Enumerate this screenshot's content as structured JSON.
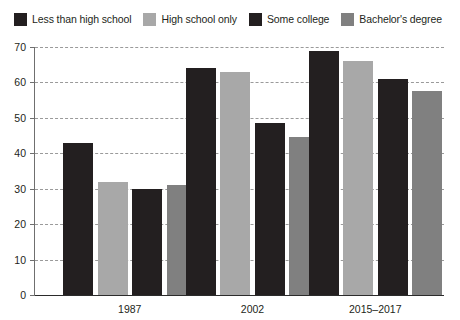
{
  "legend": {
    "position": "top-left",
    "items": [
      {
        "label": "Less than high school",
        "color": "#231f20",
        "swatch_name": "legend-swatch-less-than-high-school"
      },
      {
        "label": "High school only",
        "color": "#a8a8a8",
        "swatch_name": "legend-swatch-high-school-only"
      },
      {
        "label": "Some college",
        "color": "#231f20",
        "swatch_name": "legend-swatch-some-college"
      },
      {
        "label": "Bachelor's degree",
        "color": "#808080",
        "swatch_name": "legend-swatch-bachelors-degree"
      }
    ]
  },
  "axes": {
    "y_ticks": [
      0,
      10,
      20,
      30,
      40,
      50,
      60,
      70
    ],
    "y_min": 0,
    "y_max": 70,
    "x_labels": [
      "1987",
      "2002",
      "2015–2017"
    ]
  },
  "chart_data": {
    "type": "bar",
    "title": "",
    "subtitle": "",
    "xlabel": "",
    "ylabel": "",
    "ylim": [
      0,
      70
    ],
    "yticks": [
      0,
      10,
      20,
      30,
      40,
      50,
      60,
      70
    ],
    "grid": true,
    "legend_position": "top-left",
    "categories": [
      "1987",
      "2002",
      "2015–2017"
    ],
    "series": [
      {
        "name": "Less than high school",
        "color": "#231f20",
        "values": [
          43,
          64,
          69
        ]
      },
      {
        "name": "High school only",
        "color": "#a8a8a8",
        "values": [
          32,
          63,
          66
        ]
      },
      {
        "name": "Some college",
        "color": "#231f20",
        "values": [
          30,
          48.5,
          61
        ]
      },
      {
        "name": "Bachelor's degree",
        "color": "#808080",
        "values": [
          31,
          44.5,
          57.5
        ]
      }
    ]
  }
}
